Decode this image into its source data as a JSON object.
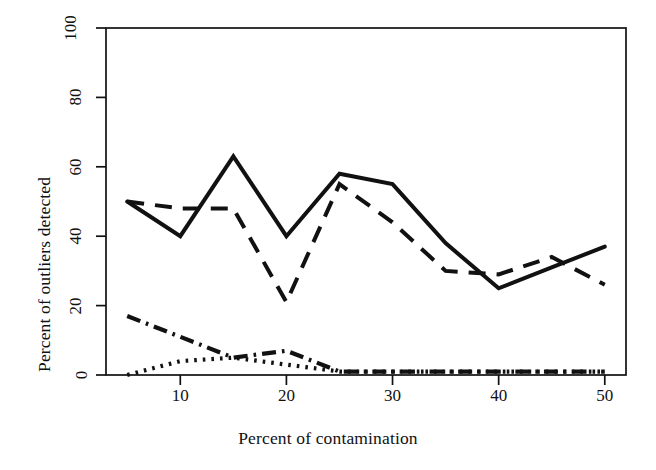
{
  "chart_data": {
    "type": "line",
    "title": "",
    "xlabel": "Percent of contamination",
    "ylabel": "Percent of outliers detected",
    "xlim": [
      3,
      52
    ],
    "ylim": [
      0,
      100
    ],
    "xticks": [
      10,
      20,
      30,
      40,
      50
    ],
    "xtick_labels": [
      "10",
      "20",
      "30",
      "40",
      "50"
    ],
    "yticks": [
      0,
      20,
      40,
      60,
      80,
      100
    ],
    "ytick_labels": [
      "0",
      "20",
      "40",
      "60",
      "80",
      "100"
    ],
    "grid": false,
    "legend": "none",
    "x": [
      5,
      10,
      15,
      20,
      25,
      30,
      35,
      40,
      45,
      50
    ],
    "series": [
      {
        "name": "solid-series",
        "linestyle": "solid",
        "color": "#111111",
        "values": [
          50,
          40,
          63,
          40,
          58,
          55,
          38,
          25,
          31,
          37
        ]
      },
      {
        "name": "dashed-series",
        "linestyle": "dashed",
        "color": "#111111",
        "values": [
          50,
          48,
          48,
          21,
          55,
          44,
          30,
          29,
          34,
          26
        ]
      },
      {
        "name": "dash-dot-series",
        "linestyle": "dashdot",
        "color": "#111111",
        "values": [
          17,
          11,
          5,
          7,
          1,
          1,
          1,
          1,
          1,
          1
        ]
      },
      {
        "name": "dotted-series",
        "linestyle": "dotted",
        "color": "#111111",
        "values": [
          0,
          4,
          5,
          3,
          1,
          1,
          1,
          1,
          1,
          1
        ]
      }
    ]
  },
  "figure": {
    "background_color": "#ffffff",
    "frame_color": "#111111"
  }
}
